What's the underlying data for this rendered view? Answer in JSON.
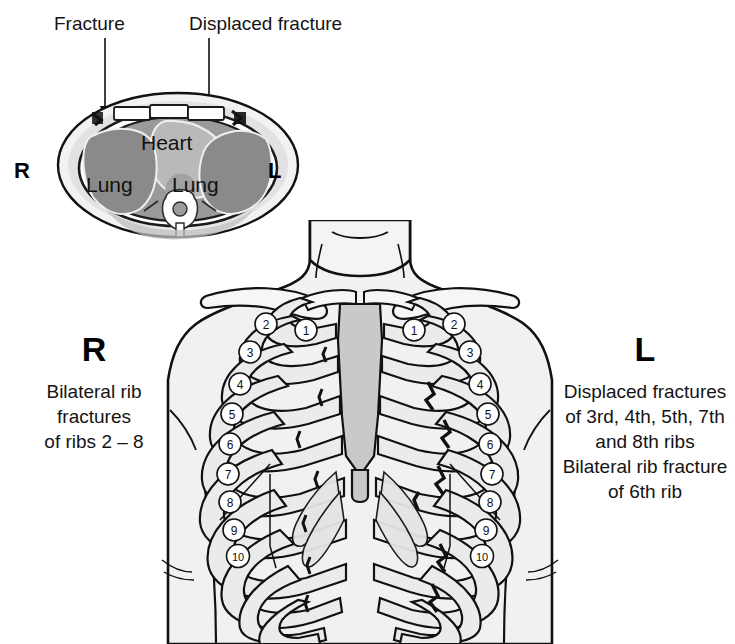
{
  "figure": {
    "type": "medical-diagram"
  },
  "callouts": {
    "fracture_label": "Fracture",
    "displaced_fracture_label": "Displaced fracture"
  },
  "cross_section": {
    "left_marker": "R",
    "right_marker": "L",
    "organs": {
      "heart": "Heart",
      "lung_right": "Lung",
      "lung_left": "Lung"
    }
  },
  "torso": {
    "right_side": {
      "marker": "R",
      "lines": [
        "Bilateral rib",
        "fractures",
        "of ribs 2 – 8"
      ]
    },
    "left_side": {
      "marker": "L",
      "lines": [
        "Displaced fractures",
        "of 3rd, 4th, 5th, 7th",
        "and 8th ribs",
        "Bilateral rib fracture",
        "of 6th rib"
      ]
    },
    "rib_numbers_right": [
      "1",
      "2",
      "3",
      "4",
      "5",
      "6",
      "7",
      "8",
      "9",
      "10"
    ],
    "rib_numbers_left": [
      "1",
      "2",
      "3",
      "4",
      "5",
      "6",
      "7",
      "8",
      "9",
      "10"
    ]
  },
  "colors": {
    "outline": "#111111",
    "skin_fill": "#f0f0f0",
    "bone_fill": "#ebebeb",
    "sternum_fill": "#c9c9c9",
    "lung_fill": "#8e8e8e",
    "heart_fill": "#b4b4b4",
    "body_wall": "#d6d6d6",
    "background": "#ffffff"
  }
}
